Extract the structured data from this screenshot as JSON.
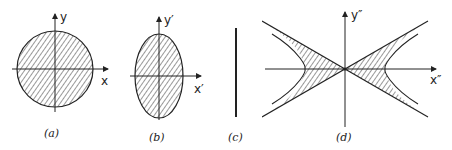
{
  "figure": {
    "panels": [
      {
        "id": "a",
        "caption": "(a)",
        "shape": "circle",
        "x_axis_label": "x",
        "y_axis_label": "y"
      },
      {
        "id": "b",
        "caption": "(b)",
        "shape": "ellipse",
        "x_axis_label": "x′",
        "y_axis_label": "y′"
      },
      {
        "id": "c",
        "caption": "(c)",
        "shape": "line segment"
      },
      {
        "id": "d",
        "caption": "(d)",
        "shape": "hyperbolic double cone",
        "x_axis_label": "x″",
        "y_axis_label": "y″"
      }
    ]
  },
  "colors": {
    "stroke": "#222222",
    "hatch": "#333333",
    "background": "#ffffff"
  }
}
